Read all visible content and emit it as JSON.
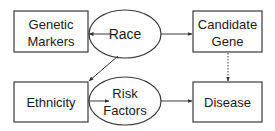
{
  "diagram": {
    "nodes": {
      "genetic_markers": {
        "line1": "Genetic",
        "line2": "Markers",
        "shape": "rectangle"
      },
      "race": {
        "label": "Race",
        "shape": "ellipse"
      },
      "candidate_gene": {
        "line1": "Candidate",
        "line2": "Gene",
        "shape": "rectangle"
      },
      "ethnicity": {
        "label": "Ethnicity",
        "shape": "rectangle"
      },
      "risk_factors": {
        "line1": "Risk",
        "line2": "Factors",
        "shape": "ellipse"
      },
      "disease": {
        "label": "Disease",
        "shape": "rectangle"
      }
    },
    "edges": [
      {
        "from": "Race",
        "to": "Genetic Markers",
        "style": "solid"
      },
      {
        "from": "Race",
        "to": "Candidate Gene",
        "style": "solid"
      },
      {
        "from": "Race",
        "to": "Ethnicity",
        "style": "solid"
      },
      {
        "from": "Ethnicity",
        "to": "Risk Factors",
        "style": "solid"
      },
      {
        "from": "Risk Factors",
        "to": "Disease",
        "style": "solid"
      },
      {
        "from": "Candidate Gene",
        "to": "Disease",
        "style": "dotted"
      }
    ],
    "colors": {
      "stroke": "#3a3a3a",
      "text": "#1a1a1a",
      "background": "#ffffff"
    }
  }
}
